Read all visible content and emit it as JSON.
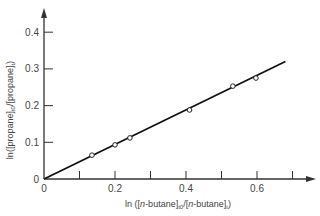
{
  "chart_data": {
    "type": "scatter",
    "title": "",
    "xlabel": "ln ([n-butane]t0/[n-butane]t)",
    "ylabel": "ln([propane]t0/[propane]t)",
    "xlim": [
      0,
      0.75
    ],
    "ylim": [
      0,
      0.45
    ],
    "x_ticks": [
      0.1,
      0.2,
      0.3,
      0.4,
      0.5,
      0.6,
      0.7
    ],
    "x_tick_labels": [
      "0",
      "0.2",
      "0.4",
      "0.6"
    ],
    "y_tick_labels": [
      "0",
      "0.1",
      "0.2",
      "0.3",
      "0.4"
    ],
    "grid": false,
    "legend": null,
    "series": [
      {
        "name": "data",
        "marker": "open-circle",
        "x": [
          0.135,
          0.2,
          0.242,
          0.41,
          0.532,
          0.597
        ],
        "y": [
          0.065,
          0.093,
          0.112,
          0.188,
          0.253,
          0.275
        ]
      },
      {
        "name": "fit",
        "type": "line",
        "x": [
          0,
          0.68
        ],
        "y": [
          0,
          0.32
        ]
      }
    ]
  },
  "labels": {
    "x_axis": {
      "prefix": "ln ([",
      "italic": "n",
      "mid1": "-butane]",
      "sub1": "t0",
      "mid2": "/[",
      "italic2": "n",
      "mid3": "-butane]",
      "sub2": "t",
      "suffix": ")"
    },
    "y_axis": {
      "prefix": "ln([propane]",
      "sub1": "t0",
      "mid": "/[propane]",
      "sub2": "t",
      "suffix": ")"
    },
    "origin_x": "0",
    "origin_y": "0"
  }
}
